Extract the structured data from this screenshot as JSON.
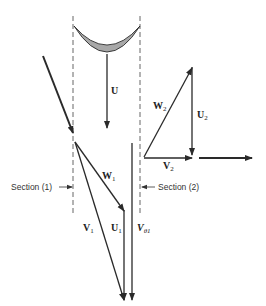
{
  "diagram": {
    "colors": {
      "line": "#2a2a2a",
      "blade_fill": "#a8a8a8",
      "dashed": "#555555",
      "background": "#ffffff"
    },
    "labels": {
      "blade_speed": {
        "main": "U",
        "sub": ""
      },
      "rel_velocity_out": {
        "main": "W",
        "sub": "2"
      },
      "blade_speed_out": {
        "main": "U",
        "sub": "2"
      },
      "abs_velocity_out": {
        "main": "V",
        "sub": "2"
      },
      "rel_velocity_in": {
        "main": "W",
        "sub": "1"
      },
      "abs_velocity_in": {
        "main": "V",
        "sub": "1"
      },
      "blade_speed_in": {
        "main": "U",
        "sub": "1"
      },
      "tangential_velocity_in": {
        "main": "V",
        "sub": "θ1"
      }
    },
    "sections": {
      "inlet": "Section (1)",
      "outlet": "Section (2)"
    }
  }
}
